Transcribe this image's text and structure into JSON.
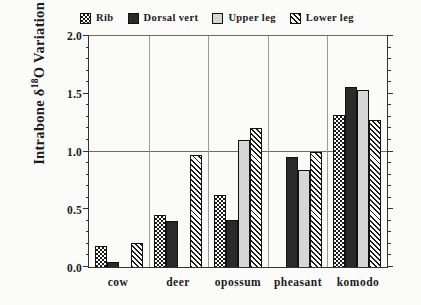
{
  "chart_data": {
    "type": "bar",
    "title": "",
    "xlabel": "",
    "ylabel": "Intrabone δ¹⁸O Variation (‰)",
    "ylabel_parts": {
      "pre": "Intrabone δ",
      "sup": "18",
      "post": "O Variation (‰)"
    },
    "categories": [
      "cow",
      "deer",
      "opossum",
      "pheasant",
      "komodo"
    ],
    "ylim": [
      0.0,
      2.0
    ],
    "yticks": [
      "0.0",
      "0.5",
      "1.0",
      "1.5",
      "2.0"
    ],
    "ytick_values": [
      0.0,
      0.5,
      1.0,
      1.5,
      2.0
    ],
    "minor_tick_step": 0.1,
    "gridlines": [
      1.0,
      2.0
    ],
    "grid": "horizontal-at-1.0-and-2.0",
    "group_separators": true,
    "legend_position": "top",
    "series": [
      {
        "name": "Rib",
        "pattern": "checkered-dots",
        "values": [
          0.18,
          0.45,
          0.62,
          null,
          1.32
        ]
      },
      {
        "name": "Dorsal vert",
        "pattern": "solid-dark",
        "values": [
          0.04,
          0.4,
          0.41,
          0.95,
          1.56
        ]
      },
      {
        "name": "Upper leg",
        "pattern": "light-gray",
        "values": [
          null,
          null,
          1.1,
          0.84,
          1.53
        ]
      },
      {
        "name": "Lower leg",
        "pattern": "diagonal-hatch",
        "values": [
          0.21,
          0.97,
          1.2,
          1.0,
          1.27
        ]
      }
    ]
  },
  "legend": {
    "items": [
      {
        "label": "Rib",
        "swatch": "fill-rib"
      },
      {
        "label": "Dorsal vert",
        "swatch": "fill-dorsal"
      },
      {
        "label": "Upper leg",
        "swatch": "fill-upper"
      },
      {
        "label": "Lower leg",
        "swatch": "fill-lower"
      }
    ]
  }
}
